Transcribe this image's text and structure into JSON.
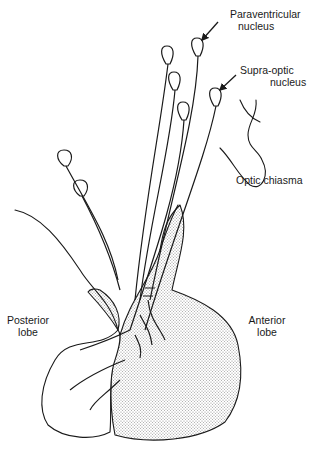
{
  "diagram": {
    "labels": {
      "paraventricular": {
        "line1": "Paraventricular",
        "line2": "nucleus"
      },
      "supraoptic": {
        "line1": "Supra-optic",
        "line2": "nucleus"
      },
      "optic_chiasma": "Optic chiasma",
      "posterior_lobe": {
        "line1": "Posterior",
        "line2": "lobe"
      },
      "anterior_lobe": {
        "line1": "Anterior",
        "line2": "lobe"
      }
    },
    "colors": {
      "stroke": "#1a1a1a",
      "stipple": "#bdbdbd",
      "background": "#ffffff"
    }
  }
}
